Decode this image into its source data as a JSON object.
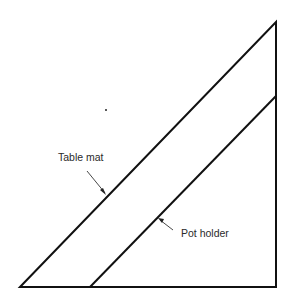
{
  "diagram": {
    "type": "cutting-layout",
    "shape": "right-triangle",
    "stroke_color": "#111111",
    "label_color": "#2a2a2a",
    "labels": {
      "table_mat": "Table mat",
      "pot_holder": "Pot holder"
    },
    "regions": [
      {
        "name": "Table mat",
        "description": "diagonal strip between hypotenuse and inner parallel line"
      },
      {
        "name": "Pot holder",
        "description": "smaller right triangle below inner parallel line"
      }
    ]
  }
}
